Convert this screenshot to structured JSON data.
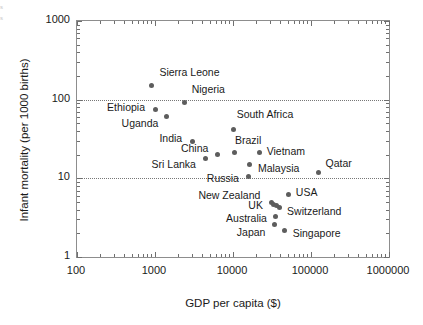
{
  "figure": {
    "edge_artifact": "s s",
    "background": "#ffffff",
    "frame_color": "#8d8d8d",
    "marker_color": "#5d5d5d",
    "grid_color": "#777777"
  },
  "chart_data": {
    "type": "scatter",
    "title": "",
    "xlabel": "GDP per capita ($)",
    "ylabel": "Infant mortality (per 1000 births)",
    "xscale": "log",
    "yscale": "log",
    "xlim": [
      100,
      1000000
    ],
    "ylim": [
      1,
      1000
    ],
    "grid": true,
    "gridlines_y": [
      100,
      10
    ],
    "legend": "none",
    "xticks": [
      100,
      1000,
      10000,
      100000,
      1000000
    ],
    "xtick_labels": [
      "100",
      "1000",
      "10000",
      "100000",
      "1000000"
    ],
    "yticks": [
      1,
      10,
      100,
      1000
    ],
    "ytick_labels": [
      "1",
      "10",
      "100",
      "1000"
    ],
    "points": [
      {
        "label": "Sierra Leone",
        "x": 900,
        "y": 150,
        "label_dx": 9,
        "label_dy": -13,
        "label_anchor": "left"
      },
      {
        "label": "Nigeria",
        "x": 2400,
        "y": 92,
        "label_dx": 8,
        "label_dy": -13,
        "label_anchor": "left"
      },
      {
        "label": "Ethiopia",
        "x": 1000,
        "y": 75,
        "label_dx": -9,
        "label_dy": -1,
        "label_anchor": "right"
      },
      {
        "label": "Uganda",
        "x": 1400,
        "y": 61,
        "label_dx": -7,
        "label_dy": 7,
        "label_anchor": "right"
      },
      {
        "label": "India",
        "x": 3000,
        "y": 29,
        "label_dx": -9,
        "label_dy": -3,
        "label_anchor": "right"
      },
      {
        "label": "China",
        "x": 6300,
        "y": 20,
        "label_dx": -8,
        "label_dy": -6,
        "label_anchor": "right"
      },
      {
        "label": "Sri Lanka",
        "x": 4500,
        "y": 18,
        "label_dx": -9,
        "label_dy": 7,
        "label_anchor": "right"
      },
      {
        "label": "South Africa",
        "x": 10200,
        "y": 42,
        "label_dx": 4,
        "label_dy": -14,
        "label_anchor": "left"
      },
      {
        "label": "Brazil",
        "x": 10300,
        "y": 21,
        "label_dx": 2,
        "label_dy": -12,
        "label_anchor": "left"
      },
      {
        "label": "Vietnam",
        "x": 22000,
        "y": 21,
        "label_dx": 8,
        "label_dy": -1,
        "label_anchor": "left"
      },
      {
        "label": "Russia",
        "x": 16000,
        "y": 10.5,
        "label_dx": -9,
        "label_dy": 2,
        "label_anchor": "right"
      },
      {
        "label": "Malaysia",
        "x": 16500,
        "y": 15,
        "label_dx": 9,
        "label_dy": 5,
        "label_anchor": "left"
      },
      {
        "label": "Qatar",
        "x": 125000,
        "y": 12,
        "label_dx": 8,
        "label_dy": -8,
        "label_anchor": "left"
      },
      {
        "label": "USA",
        "x": 52000,
        "y": 6.2,
        "label_dx": 8,
        "label_dy": -2,
        "label_anchor": "left"
      },
      {
        "label": "New Zealand",
        "x": 31000,
        "y": 4.9,
        "label_dx": -10,
        "label_dy": -7,
        "label_anchor": "right"
      },
      {
        "label": "UK",
        "x": 33500,
        "y": 4.7,
        "label_dx": -10,
        "label_dy": 2,
        "label_anchor": "right"
      },
      {
        "label": "Switzerland",
        "x": 39000,
        "y": 4.2,
        "label_dx": 9,
        "label_dy": 4,
        "label_anchor": "left"
      },
      {
        "label": "Australia",
        "x": 35500,
        "y": 3.3,
        "label_dx": -8,
        "label_dy": 3,
        "label_anchor": "right"
      },
      {
        "label": "Japan",
        "x": 34000,
        "y": 2.6,
        "label_dx": -8,
        "label_dy": 9,
        "label_anchor": "right"
      },
      {
        "label": "Singapore",
        "x": 46000,
        "y": 2.2,
        "label_dx": 9,
        "label_dy": 4,
        "label_anchor": "left"
      }
    ],
    "extra_markers": [
      {
        "x": 36500,
        "y": 4.45
      }
    ]
  }
}
